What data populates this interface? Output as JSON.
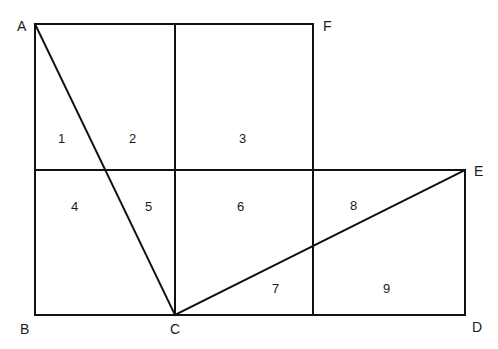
{
  "diagram": {
    "type": "geometric-figure",
    "points": {
      "A": {
        "label": "A",
        "x": 35,
        "y": 24
      },
      "B": {
        "label": "B",
        "x": 35,
        "y": 315
      },
      "C": {
        "label": "C",
        "x": 175,
        "y": 315
      },
      "D": {
        "label": "D",
        "x": 465,
        "y": 315
      },
      "E": {
        "label": "E",
        "x": 465,
        "y": 170
      },
      "F": {
        "label": "F",
        "x": 313,
        "y": 24
      }
    },
    "segments": [
      {
        "name": "top-edge-AF",
        "from": "A",
        "to": "F"
      },
      {
        "name": "left-edge-AB",
        "from": "A",
        "to": "B"
      },
      {
        "name": "bottom-edge-BD",
        "from": "B",
        "to": "D"
      },
      {
        "name": "right-edge-ED",
        "from": "E",
        "to": "D"
      },
      {
        "name": "diagonal-AC",
        "from": "A",
        "to": "C"
      },
      {
        "name": "diagonal-CE",
        "from": "C",
        "to": "E"
      }
    ],
    "regions": [
      {
        "id": "1",
        "label": "1",
        "x": 63,
        "y": 142
      },
      {
        "id": "2",
        "label": "2",
        "x": 133,
        "y": 142
      },
      {
        "id": "3",
        "label": "3",
        "x": 244,
        "y": 142
      },
      {
        "id": "4",
        "label": "4",
        "x": 75,
        "y": 210
      },
      {
        "id": "5",
        "label": "5",
        "x": 149,
        "y": 210
      },
      {
        "id": "6",
        "label": "6",
        "x": 241,
        "y": 210
      },
      {
        "id": "7",
        "label": "7",
        "x": 276,
        "y": 292
      },
      {
        "id": "8",
        "label": "8",
        "x": 354,
        "y": 209
      },
      {
        "id": "9",
        "label": "9",
        "x": 387,
        "y": 292
      }
    ]
  }
}
